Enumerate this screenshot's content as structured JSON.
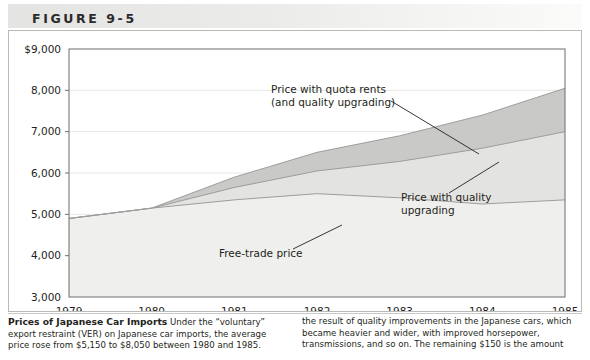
{
  "figure": {
    "number": "FIGURE 9-5"
  },
  "caption": {
    "title": "Prices of Japanese Car Imports",
    "left_text": "Under the “voluntary” export restraint (VER) on Japanese car imports, the average price rose from $5,150 to $8,050 between 1980 and 1985.",
    "right_text": "the result of quality improvements in the Japanese cars, which became heavier and wider, with improved horsepower, transmissions, and so on. The remaining $150 is the amount"
  },
  "chart_data": {
    "type": "area",
    "title": "Prices of Japanese Car Imports",
    "xlabel": "",
    "ylabel": "",
    "x": [
      1979,
      1980,
      1981,
      1982,
      1983,
      1984,
      1985
    ],
    "xtick_labels": [
      "1979",
      "1980",
      "1981",
      "1982",
      "1983",
      "1984",
      "1985"
    ],
    "ytick_labels": [
      "$9,000",
      "8,000",
      "7,000",
      "6,000",
      "5,000",
      "4,000",
      "3,000"
    ],
    "yticks": [
      9000,
      8000,
      7000,
      6000,
      5000,
      4000,
      3000
    ],
    "ylim": [
      3000,
      9000
    ],
    "xlim": [
      1979,
      1985
    ],
    "grid": true,
    "legend": "none",
    "series": [
      {
        "name": "Price with quota rents (and quality upgrading)",
        "key": "quota_rents",
        "color": "#c9c9c7",
        "values": [
          4900,
          5150,
          5900,
          6500,
          6900,
          7400,
          8050
        ]
      },
      {
        "name": "Price with quality upgrading",
        "key": "quality_upgrading",
        "color": "#e3e3e1",
        "values": [
          4900,
          5150,
          5650,
          6050,
          6280,
          6600,
          7000
        ]
      },
      {
        "name": "Free-trade price",
        "key": "free_trade",
        "color": "#efefed",
        "values": [
          4900,
          5150,
          5350,
          5500,
          5400,
          5250,
          5350
        ]
      }
    ],
    "annotations": [
      {
        "key": "quota-rents",
        "line1": "Price with quota rents",
        "line2": "(and quality upgrading)",
        "text_x": 262,
        "text_y": 62,
        "leader": [
          382,
          70,
          470,
          123
        ]
      },
      {
        "key": "quality-upgrading",
        "line1": "Price with quality",
        "line2": "upgrading",
        "text_x": 392,
        "text_y": 170,
        "leader": [
          440,
          162,
          490,
          131
        ]
      },
      {
        "key": "free-trade",
        "line1": "Free-trade price",
        "line2": "",
        "text_x": 210,
        "text_y": 226,
        "leader": [
          284,
          218,
          333,
          194
        ]
      }
    ]
  },
  "colors": {
    "band_top": "#c9c9c7",
    "band_middle": "#e3e3e1",
    "band_bottom": "#efefed",
    "axis": "#6d6d6b",
    "grid": "#e8e8e6",
    "text": "#231f20"
  }
}
